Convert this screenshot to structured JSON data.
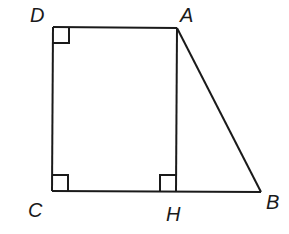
{
  "figure": {
    "type": "geometry",
    "points": {
      "A": {
        "label": "A",
        "x": 177,
        "y": 28
      },
      "B": {
        "label": "B",
        "x": 261,
        "y": 192
      },
      "C": {
        "label": "C",
        "x": 52,
        "y": 191
      },
      "D": {
        "label": "D",
        "x": 53,
        "y": 27
      },
      "H": {
        "label": "H",
        "x": 176,
        "y": 191
      }
    },
    "segments": [
      "DA",
      "AB",
      "BC",
      "CD",
      "AH"
    ],
    "right_angles": [
      "D",
      "C",
      "H"
    ],
    "colors": {
      "stroke": "#1a1a1a",
      "background": "#ffffff"
    }
  }
}
